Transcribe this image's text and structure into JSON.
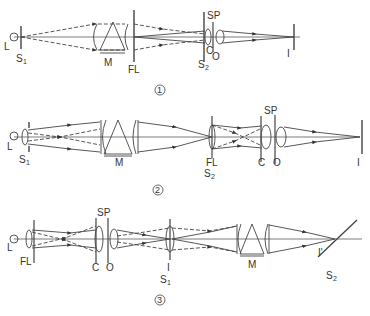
{
  "figure": {
    "diagrams": [
      {
        "number": "1",
        "labels": {
          "lamp": "L",
          "slit1": "S",
          "slit1_sub": "1",
          "prism": "M",
          "field_lens": "FL",
          "stop": "SP",
          "slit2": "S",
          "slit2_sub": "2",
          "condenser": "C",
          "objective": "O",
          "image": "I"
        }
      },
      {
        "number": "2",
        "labels": {
          "lamp": "L",
          "slit1": "S",
          "slit1_sub": "1",
          "prism": "M",
          "field_lens": "FL",
          "slit2": "S",
          "slit2_sub": "2",
          "stop": "SP",
          "condenser": "C",
          "objective": "O",
          "image": "I"
        }
      },
      {
        "number": "3",
        "labels": {
          "lamp": "L",
          "field_lens": "FL",
          "stop": "SP",
          "condenser": "C",
          "objective": "O",
          "intermediate_image": "I",
          "slit1": "S",
          "slit1_sub": "1",
          "prism": "M",
          "final_image": "I'",
          "slit2": "S",
          "slit2_sub": "2"
        }
      }
    ]
  }
}
